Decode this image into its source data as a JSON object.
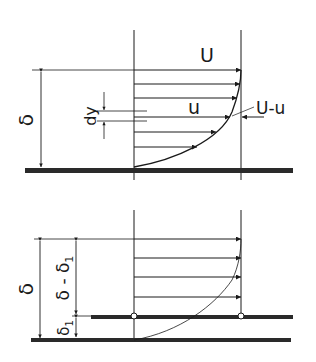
{
  "figure": {
    "top_panel": {
      "labels": {
        "free_stream": "U",
        "local_velocity": "u",
        "velocity_deficit": "U-u",
        "thickness": "δ",
        "element": "dy"
      }
    },
    "bottom_panel": {
      "labels": {
        "thickness": "δ",
        "outer": "δ - δ",
        "outer_sub": "1",
        "displacement": "δ",
        "displacement_sub": "1"
      }
    },
    "colors": {
      "line": "#1a1a1a",
      "wall": "#2a2a2a",
      "background": "#ffffff"
    }
  }
}
